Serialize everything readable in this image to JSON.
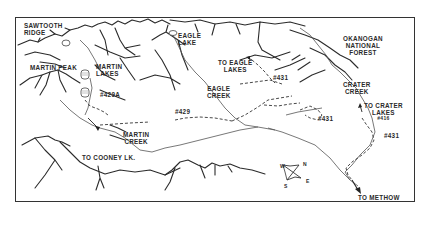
{
  "map": {
    "labels": {
      "sawtooth_ridge": "SAWTOOTH\nRIDGE",
      "sawtooth_line1": "SAWTOOTH",
      "sawtooth_line2": "RIDGE",
      "martin_peak": "MARTIN PEAK",
      "martin_lakes_1": "MARTIN",
      "martin_lakes_2": "LAKES",
      "trail_429a": "#429A",
      "eagle_lake_1": "EAGLE",
      "eagle_lake_2": "LAKE",
      "to_eagle_lakes_1": "TO EAGLE",
      "to_eagle_lakes_2": "LAKES",
      "trail_431_top": "#431",
      "okanogan_1": "OKANOGAN",
      "okanogan_2": "NATIONAL",
      "okanogan_3": "FOREST",
      "crater_creek_1": "CRATER",
      "crater_creek_2": "CREEK",
      "to_crater_lakes_1": "TO CRATER",
      "to_crater_lakes_2": "LAKES",
      "trail_416": "#416",
      "trail_431_right": "#431",
      "eagle_creek_1": "EAGLE",
      "eagle_creek_2": "CREEK",
      "trail_429": "#429",
      "trail_431_mid": "#431",
      "martin_creek_1": "MARTIN",
      "martin_creek_2": "CREEK",
      "to_cooney": "TO COONEY LK.",
      "to_methow": "TO METHOW"
    },
    "compass": {
      "n": "N",
      "s": "S",
      "e": "E",
      "w": "W"
    }
  }
}
